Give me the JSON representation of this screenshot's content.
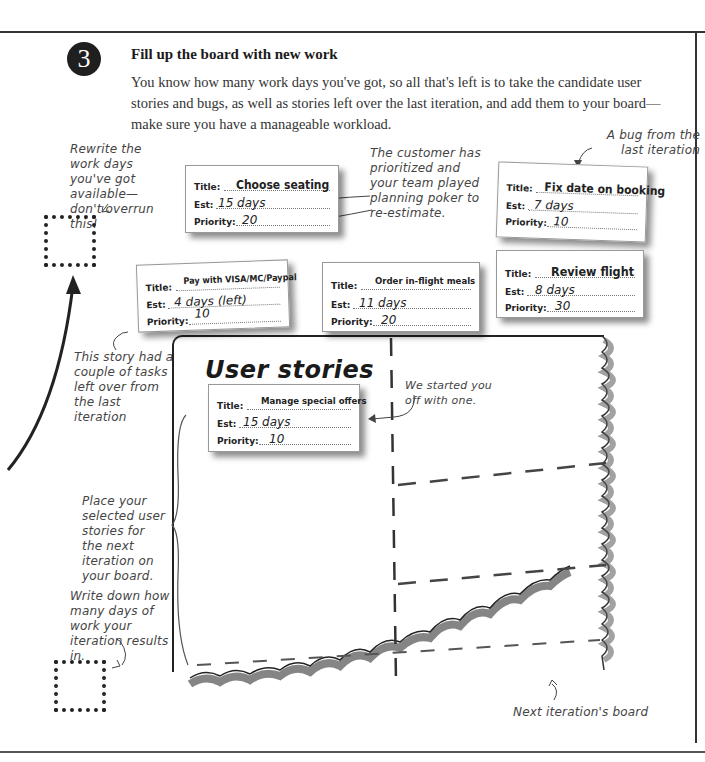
{
  "page": {
    "step_number": "3",
    "step_title": "Fill up the board with new work",
    "step_body": "You know how many work days you've got, so all that's left is to take the candidate user stories and bugs, as well as stories left over the last iteration, and add them to your board—make sure you have a manageable workload."
  },
  "annotations": {
    "rewrite_days": "Rewrite the work days you've got available—don't overrun this!",
    "customer_prioritized": "The customer has prioritized and your team played planning poker to re-estimate.",
    "bug_from_last": "A bug from the last iteration",
    "story_leftover": "This story had a couple of tasks left over from the last iteration",
    "started_with_one": "We started you off with one.",
    "place_stories": "Place your selected user stories for the next iteration on your board.",
    "write_days": "Write down how many days of work your iteration results in.",
    "next_board": "Next iteration's board"
  },
  "labels": {
    "title": "Title:",
    "est": "Est:",
    "priority": "Priority:"
  },
  "cards": [
    {
      "title": "Choose seating",
      "est": "15 days",
      "priority": "20"
    },
    {
      "title": "Fix date on booking",
      "est": "7 days",
      "priority": "10"
    },
    {
      "title": "Pay with VISA/MC/Paypal",
      "est": "4 days (left)",
      "priority": "10"
    },
    {
      "title": "Order in-flight meals",
      "est": "11 days",
      "priority": "20"
    },
    {
      "title": "Review flight",
      "est": "8 days",
      "priority": "30"
    },
    {
      "title": "Manage special offers",
      "est": "15 days",
      "priority": "10"
    }
  ],
  "board": {
    "title": "User stories"
  }
}
